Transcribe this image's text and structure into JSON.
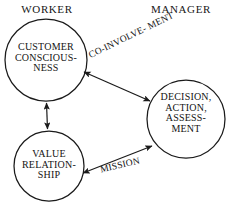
{
  "diagram": {
    "title_columns": {
      "worker": "WORKER",
      "manager": "MANAGER"
    },
    "nodes": [
      {
        "id": "customer-consciousness",
        "column": "WORKER",
        "lines": [
          "CUSTOMER",
          "CONSCIOUS-",
          "NESS"
        ],
        "shape": "circle",
        "cx": 46,
        "cy": 60,
        "r": 41,
        "stroke": "#1a1a1a",
        "fill": "#ffffff"
      },
      {
        "id": "value-relationship",
        "column": "WORKER",
        "lines": [
          "VALUE",
          "RELATION-",
          "SHIP"
        ],
        "shape": "circle",
        "cx": 49,
        "cy": 166,
        "r": 35,
        "stroke": "#1a1a1a",
        "fill": "#ffffff"
      },
      {
        "id": "decision-action-assessment",
        "column": "MANAGER",
        "lines": [
          "DECISION,",
          "ACTION,",
          "ASSESS-",
          "MENT"
        ],
        "shape": "circle",
        "cx": 186,
        "cy": 119,
        "r": 39,
        "stroke": "#1a1a1a",
        "fill": "#ffffff"
      }
    ],
    "edges": [
      {
        "id": "co-involvement",
        "label_lines": [
          "CO-INVOLVE-",
          "MENT"
        ],
        "from": "customer-consciousness",
        "to": "decision-action-assessment",
        "arrow": "double",
        "rotation_deg": -26
      },
      {
        "id": "mission",
        "label_lines": [
          "MISSION"
        ],
        "from": "value-relationship",
        "to": "decision-action-assessment",
        "arrow": "double",
        "rotation_deg": -13
      },
      {
        "id": "worker-internal-link",
        "label_lines": [],
        "from": "customer-consciousness",
        "to": "value-relationship",
        "arrow": "double",
        "rotation_deg": 0
      }
    ],
    "colors": {
      "stroke": "#1a1a1a",
      "text": "#131313",
      "background": "#ffffff"
    }
  }
}
